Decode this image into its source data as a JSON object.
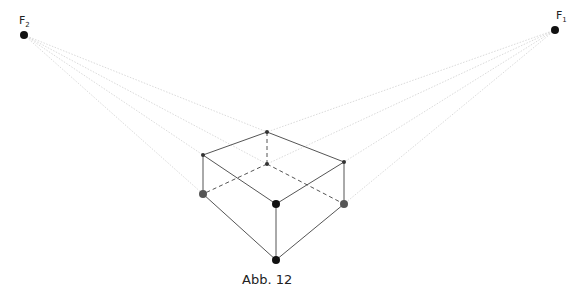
{
  "figure": {
    "caption": "Abb. 12",
    "vanishing_points": [
      {
        "id": "F1",
        "label": "F",
        "subscript": "1",
        "x": 555,
        "y": 30
      },
      {
        "id": "F2",
        "label": "F",
        "subscript": "2",
        "x": 24,
        "y": 35
      }
    ],
    "box_points": {
      "top_back": [
        267,
        132
      ],
      "top_left": [
        203,
        155
      ],
      "top_right": [
        344,
        162
      ],
      "inner_center": [
        267,
        164
      ],
      "left_mid": [
        203,
        194
      ],
      "front_top": [
        276,
        204
      ],
      "right_mid": [
        344,
        204
      ],
      "front_bottom": [
        276,
        260
      ]
    },
    "colors": {
      "solid_edge": "#555555",
      "guide_line": "#cfcfcf",
      "point": "#111111",
      "point_gray": "#555555"
    }
  }
}
